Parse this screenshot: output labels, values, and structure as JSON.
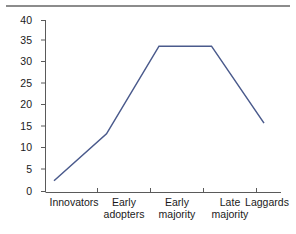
{
  "figure": {
    "has_top_rule": true,
    "rule_color": "#8c8c8c",
    "background": "#ffffff"
  },
  "chart_data": {
    "type": "line",
    "title": "",
    "subtitle": "",
    "xlabel": "",
    "ylabel": "",
    "categories": [
      "Innovators",
      "Early adopters",
      "Early majority",
      "Late majority",
      "Laggards"
    ],
    "category_lines": [
      [
        "Innovators"
      ],
      [
        "Early",
        "adopters"
      ],
      [
        "Early",
        "majority"
      ],
      [
        "Late",
        "majority"
      ],
      [
        "Laggards"
      ]
    ],
    "values": [
      2.5,
      13.5,
      34,
      34,
      16
    ],
    "series": [
      {
        "name": "Adopter distribution",
        "values": [
          2.5,
          13.5,
          34,
          34,
          16
        ],
        "color": "#4a5a8c"
      }
    ],
    "ylim": [
      0,
      40
    ],
    "yticks": [
      0,
      5,
      10,
      15,
      20,
      25,
      30,
      35,
      40
    ],
    "ytick_labels": [
      "0",
      "5",
      "10",
      "15",
      "20",
      "25",
      "30",
      "35",
      "40"
    ],
    "xtick_labels": [
      "Innovators",
      "Early adopters",
      "Early majority",
      "Late majority",
      "Laggards"
    ],
    "grid": false,
    "legend": false,
    "legend_position": "none",
    "line_color": "#4a5a8c",
    "line_width": 1.5,
    "markers": false,
    "axis_color": "#5a5a5a"
  }
}
